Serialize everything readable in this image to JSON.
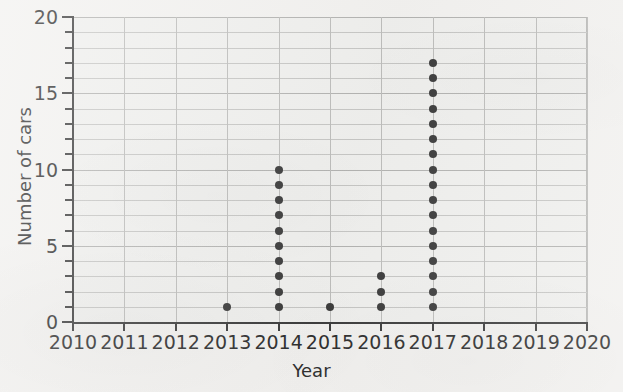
{
  "chart_data": {
    "type": "scatter",
    "plot_style": "dot-plot",
    "title": "",
    "xlabel": "Year",
    "ylabel": "Number of cars",
    "xlim": [
      2010,
      2020
    ],
    "ylim": [
      0,
      20
    ],
    "x_tick_labels": [
      "2010",
      "2011",
      "2012",
      "2013",
      "2014",
      "2015",
      "2016",
      "2017",
      "2018",
      "2019",
      "2020"
    ],
    "x_ticks": [
      2010,
      2011,
      2012,
      2013,
      2014,
      2015,
      2016,
      2017,
      2018,
      2019,
      2020
    ],
    "y_tick_labels": [
      "0",
      "5",
      "10",
      "15",
      "20"
    ],
    "y_major_ticks": [
      0,
      5,
      10,
      15,
      20
    ],
    "y_minor_ticks": [
      1,
      2,
      3,
      4,
      6,
      7,
      8,
      9,
      11,
      12,
      13,
      14,
      16,
      17,
      18,
      19
    ],
    "grid": true,
    "grid_interval_y": 1,
    "grid_interval_x": 1,
    "legend": "none",
    "categories": [
      2010,
      2011,
      2012,
      2013,
      2014,
      2015,
      2016,
      2017,
      2018,
      2019,
      2020
    ],
    "values": [
      0,
      0,
      0,
      1,
      10,
      1,
      3,
      17,
      0,
      0,
      0
    ],
    "points": [
      {
        "x": 2013,
        "y": 1
      },
      {
        "x": 2014,
        "y": 1
      },
      {
        "x": 2014,
        "y": 2
      },
      {
        "x": 2014,
        "y": 3
      },
      {
        "x": 2014,
        "y": 4
      },
      {
        "x": 2014,
        "y": 5
      },
      {
        "x": 2014,
        "y": 6
      },
      {
        "x": 2014,
        "y": 7
      },
      {
        "x": 2014,
        "y": 8
      },
      {
        "x": 2014,
        "y": 9
      },
      {
        "x": 2014,
        "y": 10
      },
      {
        "x": 2015,
        "y": 1
      },
      {
        "x": 2016,
        "y": 1
      },
      {
        "x": 2016,
        "y": 2
      },
      {
        "x": 2016,
        "y": 3
      },
      {
        "x": 2017,
        "y": 1
      },
      {
        "x": 2017,
        "y": 2
      },
      {
        "x": 2017,
        "y": 3
      },
      {
        "x": 2017,
        "y": 4
      },
      {
        "x": 2017,
        "y": 5
      },
      {
        "x": 2017,
        "y": 6
      },
      {
        "x": 2017,
        "y": 7
      },
      {
        "x": 2017,
        "y": 8
      },
      {
        "x": 2017,
        "y": 9
      },
      {
        "x": 2017,
        "y": 10
      },
      {
        "x": 2017,
        "y": 11
      },
      {
        "x": 2017,
        "y": 12
      },
      {
        "x": 2017,
        "y": 13
      },
      {
        "x": 2017,
        "y": 14
      },
      {
        "x": 2017,
        "y": 15
      },
      {
        "x": 2017,
        "y": 16
      },
      {
        "x": 2017,
        "y": 17
      }
    ],
    "colors": {
      "dot": "#3c3c3c",
      "axis": "#3d3d3d",
      "gridline": "#c6c6c4",
      "gridline_major": "#b3b3b1",
      "plot_background": "#efefed",
      "page_background": "#f2f1ef",
      "text": "#2f2f2f"
    }
  }
}
